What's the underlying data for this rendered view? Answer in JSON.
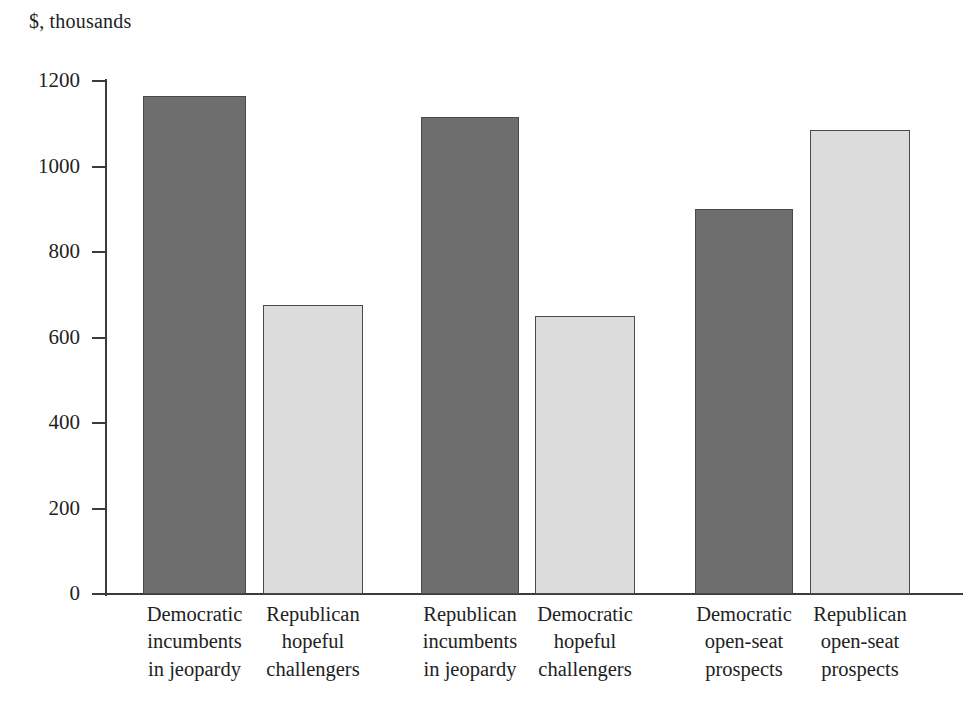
{
  "chart_data": {
    "type": "bar",
    "title": "",
    "subtitle": "",
    "xlabel": "",
    "ylabel": "$, thousands",
    "ylim": [
      0,
      1200
    ],
    "grid": false,
    "legend": "none",
    "y_ticks": [
      0,
      200,
      400,
      600,
      800,
      1000,
      1200
    ],
    "y_tick_labels": [
      "0",
      "200",
      "400",
      "600",
      "800",
      "1000",
      "1200"
    ],
    "categories": [
      "Democratic incumbents in jeopardy",
      "Republican hopeful challengers",
      "Republican incumbents in jeopardy",
      "Democratic hopeful challengers",
      "Democratic open-seat prospects",
      "Republican open-seat prospects"
    ],
    "category_lines": [
      [
        "Democratic",
        "incumbents",
        "in jeopardy"
      ],
      [
        "Republican",
        "hopeful",
        "challengers"
      ],
      [
        "Republican",
        "incumbents",
        "in jeopardy"
      ],
      [
        "Democratic",
        "hopeful",
        "challengers"
      ],
      [
        "Democratic",
        "open-seat",
        "prospects"
      ],
      [
        "Republican",
        "open-seat",
        "prospects"
      ]
    ],
    "values": [
      1165,
      675,
      1115,
      650,
      900,
      1085
    ],
    "bar_colors": [
      "dark",
      "light",
      "dark",
      "light",
      "dark",
      "light"
    ],
    "colors": {
      "dark": "#6e6e6e",
      "light": "#dcdcdc",
      "border": "#4a4a4a",
      "axis": "#3b3b3b",
      "text": "#222222",
      "background": "#ffffff"
    }
  }
}
